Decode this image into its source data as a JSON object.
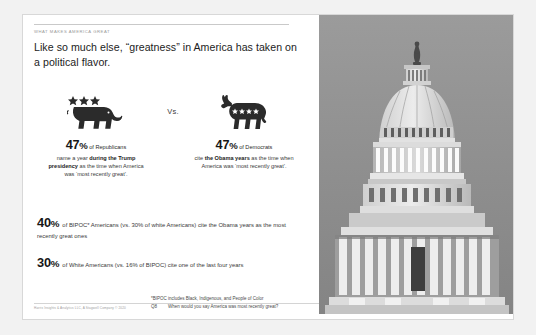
{
  "slide": {
    "kicker": "WHAT MAKES AMERICA GREAT",
    "headline": "Like so much else, “greatness” in America has taken on a political flavor.",
    "vs_label": "Vs."
  },
  "parties": [
    {
      "icon": "republican-elephant-icon",
      "percent": "47",
      "percent_symbol": "%",
      "subject": "of Republicans",
      "body_pre": "name a year ",
      "body_bold": "during the Trump presidency",
      "body_post": " as the time when America was ‘most recently great’."
    },
    {
      "icon": "democrat-donkey-icon",
      "percent": "47",
      "percent_symbol": "%",
      "subject": "of Democrats",
      "body_pre": "cite ",
      "body_bold": "the Obama years",
      "body_post": " as the time when America was ‘most recently great’."
    }
  ],
  "wide_stats": [
    {
      "percent": "40",
      "percent_symbol": "%",
      "text": "of BIPOC* Americans (vs. 30% of white Americans) cite the Obama years as the most recently great ones"
    },
    {
      "percent": "30",
      "percent_symbol": "%",
      "text": "of White Americans (vs. 16% of BIPOC) cite one of the last four years"
    }
  ],
  "footnotes": {
    "bipoc_note": "*BIPOC includes Black, Indigenous, and People of Color",
    "question_label": "Q8",
    "question_text": "When would you say America was most recently great?",
    "source": "Harris Insights & Analytics LLC, A Stagwell Company © 2020"
  },
  "photo": {
    "alt": "us-capitol-dome-photo"
  },
  "colors": {
    "card_background": "#ffffff",
    "page_background": "#f2f2f2",
    "headline_text": "#1c1c1c",
    "kicker_text": "#9a9a9a",
    "mascot_fill": "#2b2b2b",
    "rule": "#c9c9c9"
  }
}
